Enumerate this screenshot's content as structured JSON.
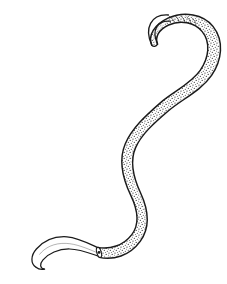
{
  "figure": {
    "title": "Nematode worm line illustration",
    "subject_name": "nematode-worm",
    "caption": "",
    "background_color": "#ffffff",
    "ink_color": "#1a1a1a",
    "stipple_color": "#2b2b2b",
    "canvas": {
      "width": 227,
      "height": 284
    }
  },
  "illustration": {
    "style": "stippled pen-and-ink scientific drawing",
    "parts": [
      {
        "id": "anterior-hook",
        "label": "anterior end",
        "description": "thin tapering filament curving into a hook at upper right, unshaded",
        "shaded": false
      },
      {
        "id": "body",
        "label": "body",
        "description": "thick sinuous S-curved trunk with dense stipple shading and dark outline",
        "shaded": true
      },
      {
        "id": "tail",
        "label": "posterior tail",
        "description": "slender smooth unshaded tail curving to the lower left ending in a rounded tip",
        "shaded": false
      }
    ],
    "geometry": {
      "head_tip": [
        151,
        46
      ],
      "curl_apex": [
        196,
        22
      ],
      "curl_right": [
        214,
        60
      ],
      "mid_upper": [
        160,
        96
      ],
      "mid_waist": [
        122,
        142
      ],
      "mid_lower": [
        127,
        196
      ],
      "body_tail_junction": [
        98,
        252
      ],
      "tail_mid": [
        62,
        243
      ],
      "tail_tip": [
        31,
        262
      ],
      "body_outline": "M151,46 C146,36 152,26 166,20 C182,13 200,16 209,27 C220,40 218,58 209,72 C199,87 180,96 167,107 C151,120 139,131 133,145 C126,161 131,178 138,193 C146,210 148,226 138,240 C128,253 113,257 100,254",
      "body_widths": [
        2.0,
        5.5,
        9.0,
        11.5,
        13.0,
        13.5,
        13.0,
        12.0,
        11.5,
        11.0,
        10.5,
        9.5,
        8.5
      ],
      "tail_outline": "M100,254 C86,250 74,244 62,243 C49,242 39,248 34,256 C30,263 33,269 40,270 C48,271 55,266 57,260",
      "tail_widths": [
        8.5,
        7.0,
        5.5,
        4.0,
        2.5,
        1.5,
        0.8
      ]
    }
  }
}
